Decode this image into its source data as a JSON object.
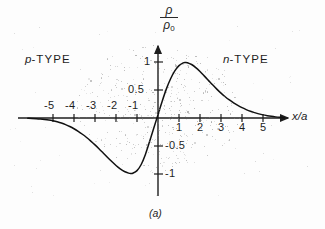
{
  "figure": {
    "caption": "(a)",
    "region_labels": {
      "left": {
        "symbol": "p",
        "text": "-TYPE"
      },
      "right": {
        "symbol": "n",
        "text": "-TYPE"
      }
    }
  },
  "chart_data": {
    "type": "line",
    "title": "",
    "subtitle": "",
    "xlabel": "x/a",
    "ylabel_numerator": "ρ",
    "ylabel_denominator": "ρ",
    "ylabel_denominator_sub": "0",
    "ylabel": "ρ/ρ₀",
    "xlim": [
      -6.6,
      6.2
    ],
    "ylim": [
      -1.45,
      1.3
    ],
    "grid": false,
    "legend": null,
    "annotations": [
      {
        "text": "p-TYPE",
        "x": -4.6,
        "y": 0.95
      },
      {
        "text": "n-TYPE",
        "x": 4.1,
        "y": 0.95
      },
      {
        "text": "(a)",
        "x": 0.0,
        "y": -1.38
      }
    ],
    "xticks": [
      -5,
      -4,
      -3,
      -2,
      -1,
      1,
      2,
      3,
      4,
      5
    ],
    "xticklabels": [
      "-5",
      "-4",
      "-3",
      "-2",
      "-1",
      "1",
      "2",
      "3",
      "4",
      "5"
    ],
    "yticks": [
      -1,
      -0.5,
      0.5,
      1
    ],
    "yticklabels": [
      "-1",
      "-0.5",
      "0.5",
      "1"
    ],
    "series": [
      {
        "name": "ρ/ρ₀",
        "x": [
          -6.2,
          -6.0,
          -5.8,
          -5.6,
          -5.4,
          -5.2,
          -5.0,
          -4.8,
          -4.6,
          -4.4,
          -4.2,
          -4.0,
          -3.8,
          -3.6,
          -3.4,
          -3.2,
          -3.0,
          -2.8,
          -2.6,
          -2.4,
          -2.2,
          -2.0,
          -1.8,
          -1.6,
          -1.4,
          -1.3,
          -1.2,
          -1.0,
          -0.8,
          -0.6,
          -0.4,
          -0.2,
          0.0,
          0.2,
          0.4,
          0.6,
          0.8,
          1.0,
          1.2,
          1.3,
          1.4,
          1.6,
          1.8,
          2.0,
          2.2,
          2.4,
          2.6,
          2.8,
          3.0,
          3.2,
          3.4,
          3.6,
          3.8,
          4.0,
          4.2,
          4.4,
          4.6,
          4.8,
          5.0,
          5.2,
          5.4,
          5.6,
          5.8,
          6.0
        ],
        "y": [
          -0.005,
          -0.008,
          -0.012,
          -0.018,
          -0.026,
          -0.036,
          -0.05,
          -0.068,
          -0.09,
          -0.118,
          -0.152,
          -0.192,
          -0.238,
          -0.29,
          -0.348,
          -0.412,
          -0.48,
          -0.552,
          -0.628,
          -0.704,
          -0.778,
          -0.848,
          -0.908,
          -0.955,
          -0.984,
          -0.99,
          -0.986,
          -0.94,
          -0.83,
          -0.65,
          -0.42,
          -0.18,
          0.06,
          0.3,
          0.52,
          0.7,
          0.84,
          0.935,
          0.985,
          0.992,
          0.988,
          0.955,
          0.9,
          0.83,
          0.752,
          0.672,
          0.592,
          0.516,
          0.444,
          0.38,
          0.322,
          0.27,
          0.224,
          0.184,
          0.15,
          0.12,
          0.096,
          0.074,
          0.056,
          0.042,
          0.03,
          0.02,
          0.012,
          0.006
        ]
      }
    ]
  }
}
